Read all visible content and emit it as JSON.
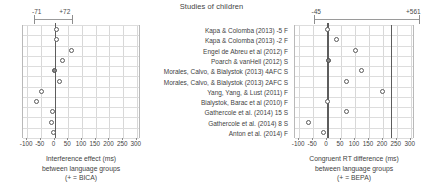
{
  "chart_data": {
    "type": "scatter",
    "title": "Studies of children",
    "panels": [
      {
        "id": "left",
        "xlabel_lines": [
          "Interference effect (ms)",
          "between language groups",
          "(+ = BICA)"
        ],
        "xlim": [
          -115,
          315
        ],
        "xticks": [
          -100,
          -50,
          0,
          50,
          100,
          150,
          200,
          250,
          300
        ],
        "xticklabels": [
          "-100",
          "-50",
          "0",
          "50",
          "100",
          "150",
          "200",
          "250",
          "300"
        ],
        "zero_line": 0,
        "ref_line": null,
        "summary_ci": {
          "low": -71,
          "high": 72,
          "low_label": "-71",
          "high_label": "+72"
        },
        "values": [
          8,
          8,
          65,
          30,
          3,
          21,
          -44,
          -64,
          -5,
          -10,
          -3
        ],
        "filled": [
          false,
          false,
          false,
          false,
          true,
          false,
          false,
          false,
          false,
          false,
          false
        ]
      },
      {
        "id": "right",
        "xlabel_lines": [
          "Congruent RT difference (ms)",
          "between language groups",
          "(+ = BEPA)"
        ],
        "xlim": [
          -115,
          315
        ],
        "xticks": [
          -100,
          -50,
          0,
          50,
          100,
          150,
          200,
          250,
          300
        ],
        "xticklabels": [
          "-100",
          "-50",
          "0",
          "50",
          "100",
          "150",
          "200",
          "250",
          "300"
        ],
        "zero_line": 0,
        "ref_line": 228,
        "summary_ci": {
          "low": -45,
          "high": 561,
          "low_label": "-45",
          "high_label": "+561"
        },
        "values": [
          2,
          37,
          104,
          7,
          126,
          70,
          202,
          3,
          70,
          -66,
          -11
        ],
        "filled": [
          false,
          false,
          false,
          true,
          false,
          false,
          false,
          false,
          false,
          false,
          false
        ]
      }
    ],
    "studies": [
      "Kapa & Colomba (2013)  -5 F",
      "Kapa & Colomba (2013)  -2 F",
      "Engel de Abreu et al (2012) F",
      "Poarch & vanHell (2012) S",
      "Morales, Calvo, & Bialystok (2013) 4AFC S",
      "Morales, Calvo, & Bialystok (2013) 2AFC S",
      "Yang, Yang, & Lust (2011) F",
      "Bialystok, Barac et al (2010) F",
      "Gathercole et al. (2014) 15 S",
      "Gathercole et al. (2014) 8 S",
      "Anton et al. (2014) F"
    ],
    "colors": {
      "point_edge": "#5a5a5a",
      "point_fill": "#ffffff",
      "point_fill_filled": "#8a8a8a",
      "zero_line": "#5d5d5d",
      "grid": "#d8d8d8",
      "text": "#3f3f3f"
    }
  }
}
